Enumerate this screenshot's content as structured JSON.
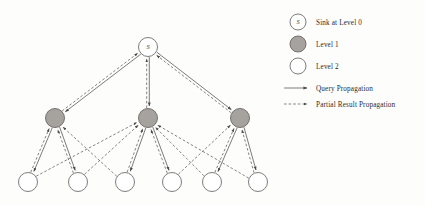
{
  "figure": {
    "type": "diagram",
    "subtype": "tree-network-routing",
    "background_color": "#fdfdfc",
    "stroke_color": "#5a5a5a",
    "node_fill_level1": "#a6a29e",
    "node_fill_open": "#ffffff"
  },
  "legend": {
    "items": [
      {
        "id": "sink",
        "marker": "circle-open-labeled",
        "marker_label": "S",
        "label": "Sink at Level 0",
        "x": 298,
        "y": 22
      },
      {
        "id": "level1",
        "marker": "circle-filled",
        "marker_label": "",
        "label": "Level 1",
        "x": 298,
        "y": 44
      },
      {
        "id": "level2",
        "marker": "circle-open",
        "marker_label": "",
        "label": "Level 2",
        "x": 298,
        "y": 66
      },
      {
        "id": "query",
        "marker": "arrow-solid",
        "marker_label": "",
        "label": "Query Propagation",
        "x": 298,
        "y": 88
      },
      {
        "id": "result",
        "marker": "arrow-dashed",
        "marker_label": "",
        "label": "Partial Result Propagation",
        "x": 298,
        "y": 104
      }
    ],
    "text_x": 316
  },
  "nodes": {
    "sink": {
      "id": "S",
      "label": "S",
      "x": 148,
      "y": 47,
      "r": 9.5,
      "style": "open",
      "level": 0
    },
    "level1": [
      {
        "id": "L1a",
        "label": "",
        "x": 55,
        "y": 118,
        "r": 9.5,
        "style": "filled",
        "level": 1
      },
      {
        "id": "L1b",
        "label": "",
        "x": 148,
        "y": 118,
        "r": 9.5,
        "style": "filled",
        "level": 1
      },
      {
        "id": "L1c",
        "label": "",
        "x": 240,
        "y": 118,
        "r": 9.5,
        "style": "filled",
        "level": 1
      }
    ],
    "level2": [
      {
        "id": "L2a",
        "label": "",
        "x": 28,
        "y": 182,
        "r": 9.5,
        "style": "open",
        "level": 2
      },
      {
        "id": "L2b",
        "label": "",
        "x": 78,
        "y": 182,
        "r": 9.5,
        "style": "open",
        "level": 2
      },
      {
        "id": "L2c",
        "label": "",
        "x": 125,
        "y": 182,
        "r": 9.5,
        "style": "open",
        "level": 2
      },
      {
        "id": "L2d",
        "label": "",
        "x": 172,
        "y": 182,
        "r": 9.5,
        "style": "open",
        "level": 2
      },
      {
        "id": "L2e",
        "label": "",
        "x": 212,
        "y": 182,
        "r": 9.5,
        "style": "open",
        "level": 2
      },
      {
        "id": "L2f",
        "label": "",
        "x": 258,
        "y": 182,
        "r": 9.5,
        "style": "open",
        "level": 2
      }
    ]
  },
  "edges": {
    "query_propagation": [
      {
        "from": "S",
        "to": "L1a"
      },
      {
        "from": "S",
        "to": "L1b"
      },
      {
        "from": "S",
        "to": "L1c"
      },
      {
        "from": "L1a",
        "to": "L2a"
      },
      {
        "from": "L1a",
        "to": "L2b"
      },
      {
        "from": "L1b",
        "to": "L2c"
      },
      {
        "from": "L1b",
        "to": "L2d"
      },
      {
        "from": "L1c",
        "to": "L2e"
      },
      {
        "from": "L1c",
        "to": "L2f"
      }
    ],
    "partial_result_propagation": [
      {
        "from": "L1a",
        "to": "S"
      },
      {
        "from": "L1b",
        "to": "S"
      },
      {
        "from": "L1c",
        "to": "S"
      },
      {
        "from": "L2a",
        "to": "L1a"
      },
      {
        "from": "L2b",
        "to": "L1a"
      },
      {
        "from": "L2c",
        "to": "L1b"
      },
      {
        "from": "L2d",
        "to": "L1b"
      },
      {
        "from": "L2e",
        "to": "L1c"
      },
      {
        "from": "L2f",
        "to": "L1c"
      },
      {
        "from": "L2c",
        "to": "L1a"
      },
      {
        "from": "L2e",
        "to": "L1b"
      },
      {
        "from": "L2b",
        "to": "L1b"
      },
      {
        "from": "L2d",
        "to": "L1c"
      },
      {
        "from": "L2f",
        "to": "L1b"
      },
      {
        "from": "L2a",
        "to": "L1b"
      }
    ]
  }
}
